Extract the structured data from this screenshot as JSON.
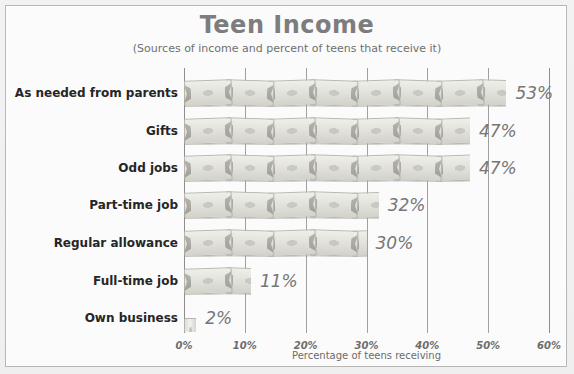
{
  "chart_data": {
    "type": "bar",
    "orientation": "horizontal",
    "title": "Teen Income",
    "subtitle": "(Sources of income and percent of teens that receive it)",
    "xlabel": "Percentage of teens receiving",
    "ylabel": "",
    "xlim": [
      0,
      60
    ],
    "xticks": [
      0,
      10,
      20,
      30,
      40,
      50,
      60
    ],
    "xtick_labels": [
      "0%",
      "10%",
      "20%",
      "30%",
      "40%",
      "50%",
      "60%"
    ],
    "grid": true,
    "legend": "none",
    "value_suffix": "%",
    "categories": [
      "As needed from parents",
      "Gifts",
      "Odd jobs",
      "Part-time job",
      "Regular allowance",
      "Full-time job",
      "Own business"
    ],
    "values": [
      53,
      47,
      47,
      32,
      30,
      11,
      2
    ],
    "data_labels": [
      "53%",
      "47%",
      "47%",
      "32%",
      "30%",
      "11%",
      "2%"
    ],
    "bar_fill": "dollar-bill-pictograph",
    "colors": {
      "title": "#7d7d7d",
      "subtitle": "#6f6f6f",
      "category_label": "#262626",
      "value_label": "#767676",
      "gridline": "#a0a0a0",
      "bar": "#e2e2db",
      "plot_background": "#fbfbfb",
      "frame_border": "#b6b6b6"
    }
  }
}
